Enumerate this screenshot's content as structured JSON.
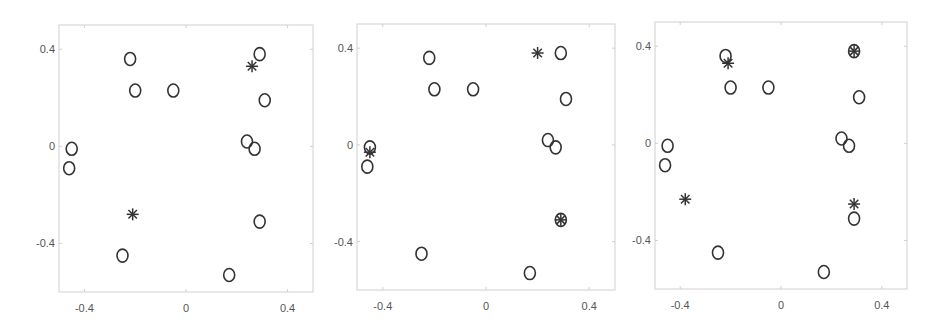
{
  "chart_data": [
    {
      "type": "scatter",
      "title": "",
      "xlabel": "",
      "ylabel": "",
      "xlim": [
        -0.5,
        0.5
      ],
      "ylim": [
        -0.6,
        0.5
      ],
      "xticks": [
        -0.4,
        0,
        0.4
      ],
      "yticks": [
        0.4,
        0,
        -0.4
      ],
      "xtick_labels": [
        "-0.4",
        "0",
        "0.4"
      ],
      "ytick_labels": [
        "0.4",
        "0",
        "-0.4"
      ],
      "grid": false,
      "series": [
        {
          "name": "points",
          "marker": "circle",
          "x": [
            -0.22,
            -0.2,
            -0.05,
            0.29,
            0.31,
            -0.45,
            -0.46,
            0.24,
            0.27,
            0.29,
            -0.25,
            0.17
          ],
          "y": [
            0.36,
            0.23,
            0.23,
            0.38,
            0.19,
            -0.01,
            -0.09,
            0.02,
            -0.01,
            -0.31,
            -0.45,
            -0.53
          ]
        },
        {
          "name": "centers",
          "marker": "asterisk",
          "x": [
            0.26,
            -0.21
          ],
          "y": [
            0.33,
            -0.28
          ]
        }
      ]
    },
    {
      "type": "scatter",
      "title": "",
      "xlabel": "",
      "ylabel": "",
      "xlim": [
        -0.5,
        0.5
      ],
      "ylim": [
        -0.6,
        0.5
      ],
      "xticks": [
        -0.4,
        0,
        0.4
      ],
      "yticks": [
        0.4,
        0,
        -0.4
      ],
      "xtick_labels": [
        "-0.4",
        "0",
        "0.4"
      ],
      "ytick_labels": [
        "0.4",
        "0",
        "-0.4"
      ],
      "grid": false,
      "series": [
        {
          "name": "points",
          "marker": "circle",
          "x": [
            -0.22,
            -0.2,
            -0.05,
            0.29,
            0.31,
            -0.45,
            -0.46,
            0.24,
            0.27,
            0.29,
            -0.25,
            0.17
          ],
          "y": [
            0.36,
            0.23,
            0.23,
            0.38,
            0.19,
            -0.01,
            -0.09,
            0.02,
            -0.01,
            -0.31,
            -0.45,
            -0.53
          ]
        },
        {
          "name": "centers",
          "marker": "asterisk",
          "x": [
            0.2,
            -0.45,
            0.29
          ],
          "y": [
            0.38,
            -0.03,
            -0.31
          ]
        }
      ]
    },
    {
      "type": "scatter",
      "title": "",
      "xlabel": "",
      "ylabel": "",
      "xlim": [
        -0.5,
        0.5
      ],
      "ylim": [
        -0.6,
        0.5
      ],
      "xticks": [
        -0.4,
        0,
        0.4
      ],
      "yticks": [
        0.4,
        0,
        -0.4
      ],
      "xtick_labels": [
        "-0.4",
        "0",
        "0.4"
      ],
      "ytick_labels": [
        "0.4",
        "0",
        "-0.4"
      ],
      "grid": false,
      "series": [
        {
          "name": "points",
          "marker": "circle",
          "x": [
            -0.22,
            -0.2,
            -0.05,
            0.29,
            0.31,
            -0.45,
            -0.46,
            0.24,
            0.27,
            0.29,
            -0.25,
            0.17
          ],
          "y": [
            0.36,
            0.23,
            0.23,
            0.38,
            0.19,
            -0.01,
            -0.09,
            0.02,
            -0.01,
            -0.31,
            -0.45,
            -0.53
          ]
        },
        {
          "name": "centers",
          "marker": "asterisk",
          "x": [
            -0.21,
            0.29,
            -0.38,
            0.29
          ],
          "y": [
            0.33,
            0.38,
            -0.23,
            -0.25
          ]
        }
      ]
    }
  ],
  "layout": {
    "panels": [
      {
        "left": 59,
        "top": 25,
        "width": 254,
        "height": 267
      },
      {
        "left": 357,
        "top": 24,
        "width": 258,
        "height": 266
      },
      {
        "left": 655,
        "top": 22,
        "width": 252,
        "height": 267
      }
    ],
    "colors": {
      "frame": "#d0d0d0",
      "marker": "#333333",
      "tick_label": "#555555"
    }
  }
}
